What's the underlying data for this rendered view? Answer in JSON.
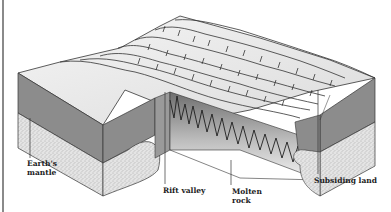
{
  "figure": {
    "type": "block diagram",
    "labels": [
      {
        "id": "mantle",
        "lines": [
          "Earth's",
          "mantle"
        ]
      },
      {
        "id": "rift",
        "lines": [
          "Rift valley"
        ]
      },
      {
        "id": "molten",
        "lines": [
          "Molten",
          "rock"
        ]
      },
      {
        "id": "subsiding",
        "lines": [
          "Subsiding land"
        ]
      }
    ],
    "colors": {
      "background": "#ffffff",
      "surface": "#ececec",
      "crust": "#8c8c8c",
      "mantle": "#d9d9d9",
      "molten_dark": "#2a2a2a",
      "outline": "#333333"
    }
  }
}
